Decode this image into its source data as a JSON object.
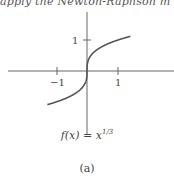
{
  "top_text": "apply the Newton-Raphson m",
  "chart_data": {
    "type": "line",
    "xlabel": "",
    "ylabel": "",
    "x_ticks": [
      -1,
      1
    ],
    "y_ticks": [
      1
    ],
    "xlim": [
      -1.3,
      1.4
    ],
    "ylim": [
      -1.3,
      1.4
    ],
    "grid": false,
    "series": [
      {
        "name": "f(x) = x^(1/3)",
        "x": [
          -1.3,
          -1.0,
          -0.6,
          -0.3,
          -0.1,
          -0.02,
          0.0,
          0.02,
          0.1,
          0.3,
          0.6,
          1.0,
          1.4
        ],
        "values": [
          -1.091,
          -1.0,
          -0.843,
          -0.669,
          -0.464,
          -0.271,
          0.0,
          0.271,
          0.464,
          0.669,
          0.843,
          1.0,
          1.119
        ]
      }
    ]
  },
  "labels": {
    "tick_x_neg1": "−1",
    "tick_x_1": "1",
    "tick_y_1": "1",
    "function_caption": "f(x) = x",
    "function_exponent": "1/3",
    "subfigure_label": "(a)"
  }
}
